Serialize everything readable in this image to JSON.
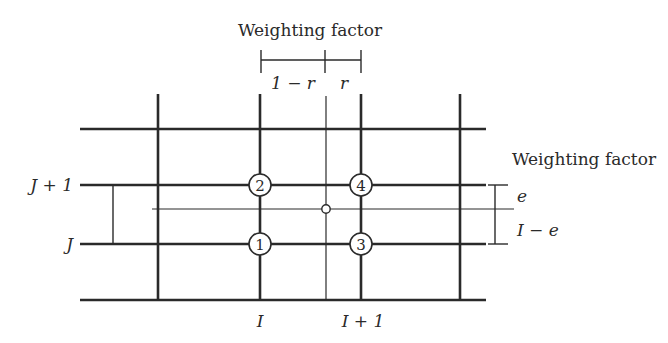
{
  "diagram": {
    "top_label": {
      "title": "Weighting factor",
      "left_segment": "1 − r",
      "right_segment": "r"
    },
    "right_label": {
      "title": "Weighting factor",
      "upper_segment": "e",
      "lower_segment": "I − e"
    },
    "row_labels": {
      "upper": "J + 1",
      "lower": "J"
    },
    "column_labels": {
      "left": "I",
      "right": "I + 1"
    },
    "nodes": [
      {
        "id": "1",
        "label": "1",
        "position": "I, J"
      },
      {
        "id": "2",
        "label": "2",
        "position": "I, J+1"
      },
      {
        "id": "3",
        "label": "3",
        "position": "I+1, J"
      },
      {
        "id": "4",
        "label": "4",
        "position": "I+1, J+1"
      }
    ],
    "interpolation_point": "open-circle",
    "colors": {
      "line": "#2a2a2a",
      "background": "#ffffff"
    }
  }
}
